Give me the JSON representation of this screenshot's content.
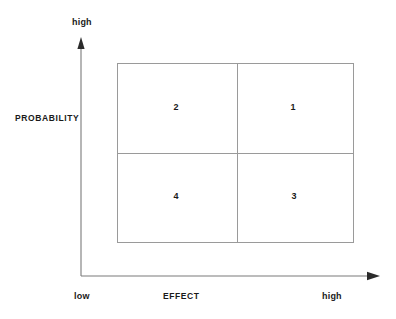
{
  "diagram": {
    "type": "2x2-matrix",
    "axes": {
      "y": {
        "title": "PROBABILITY",
        "high_label": "high",
        "arrow": "up-arrow-icon"
      },
      "x": {
        "title": "EFFECT",
        "low_label": "low",
        "high_label": "high",
        "arrow": "right-arrow-icon"
      }
    },
    "quadrants": [
      {
        "id": "q1",
        "label": "1",
        "position": "top-right"
      },
      {
        "id": "q2",
        "label": "2",
        "position": "top-left"
      },
      {
        "id": "q3",
        "label": "3",
        "position": "bottom-right"
      },
      {
        "id": "q4",
        "label": "4",
        "position": "bottom-left"
      }
    ],
    "colors": {
      "background": "#ffffff",
      "line": "#8c8c8c",
      "axis": "#7a7a7a",
      "text": "#1a1a1a"
    }
  }
}
